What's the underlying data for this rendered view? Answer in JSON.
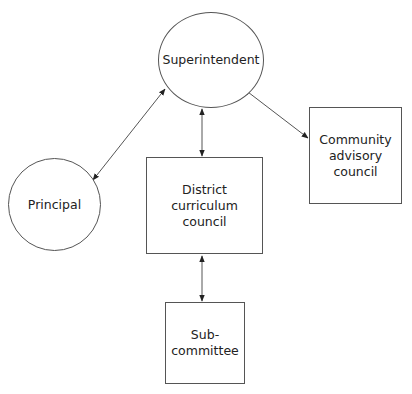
{
  "diagram": {
    "nodes": {
      "superintendent": {
        "label": "Superintendent",
        "shape": "circle"
      },
      "principal": {
        "label": "Principal",
        "shape": "circle"
      },
      "district": {
        "label": "District\ncurriculum\ncouncil",
        "shape": "rectangle"
      },
      "community": {
        "label": "Community\nadvisory\ncouncil",
        "shape": "rectangle"
      },
      "subcommittee": {
        "label": "Sub-\ncommittee",
        "shape": "rectangle"
      }
    },
    "edges": [
      {
        "from": "superintendent",
        "to": "principal",
        "direction": "both"
      },
      {
        "from": "superintendent",
        "to": "district",
        "direction": "both"
      },
      {
        "from": "superintendent",
        "to": "community",
        "direction": "both"
      },
      {
        "from": "district",
        "to": "subcommittee",
        "direction": "both"
      }
    ],
    "colors": {
      "stroke": "#555555",
      "text": "#222222",
      "background": "#ffffff"
    }
  }
}
